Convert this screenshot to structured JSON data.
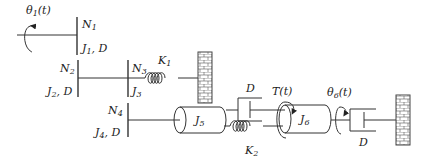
{
  "diagram": {
    "labels": {
      "theta1": {
        "sym": "θ",
        "sub": "1",
        "tail": "(t)"
      },
      "N1": {
        "sym": "N",
        "sub": "1"
      },
      "J1D": {
        "sym": "J",
        "sub": "1",
        "tail": ", D"
      },
      "N2": {
        "sym": "N",
        "sub": "2"
      },
      "J2D": {
        "sym": "J",
        "sub": "2",
        "tail": ", D"
      },
      "N3": {
        "sym": "N",
        "sub": "3"
      },
      "J3": {
        "sym": "J",
        "sub": "3"
      },
      "K1": {
        "sym": "K",
        "sub": "1"
      },
      "N4": {
        "sym": "N",
        "sub": "4"
      },
      "J4D": {
        "sym": "J",
        "sub": "4",
        "tail": ", D"
      },
      "J5": {
        "sym": "J",
        "sub": "5"
      },
      "D_top": {
        "sym": "D"
      },
      "K2": {
        "sym": "K",
        "sub": "2"
      },
      "T": {
        "sym": "T",
        "tail": "(t)"
      },
      "J6": {
        "sym": "J",
        "sub": "6"
      },
      "theta6": {
        "sym": "θ",
        "sub": "6",
        "tail": "(t)"
      },
      "D_right": {
        "sym": "D"
      }
    },
    "components": [
      {
        "id": "gear-N1",
        "type": "gear",
        "label": "N1"
      },
      {
        "id": "gear-N2",
        "type": "gear",
        "label": "N2"
      },
      {
        "id": "gear-N3",
        "type": "gear",
        "label": "N3"
      },
      {
        "id": "gear-N4",
        "type": "gear",
        "label": "N4"
      },
      {
        "id": "spring-K1",
        "type": "spring",
        "label": "K1"
      },
      {
        "id": "spring-K2",
        "type": "spring",
        "label": "K2"
      },
      {
        "id": "damper-D-top",
        "type": "damper",
        "label": "D"
      },
      {
        "id": "damper-D-right",
        "type": "damper",
        "label": "D"
      },
      {
        "id": "inertia-J5",
        "type": "inertia",
        "label": "J5"
      },
      {
        "id": "inertia-J6",
        "type": "inertia",
        "label": "J6"
      },
      {
        "id": "wall-1",
        "type": "fixed-wall"
      },
      {
        "id": "wall-2",
        "type": "fixed-wall"
      }
    ],
    "colors": {
      "stroke": "#333333",
      "background": "#ffffff"
    }
  }
}
